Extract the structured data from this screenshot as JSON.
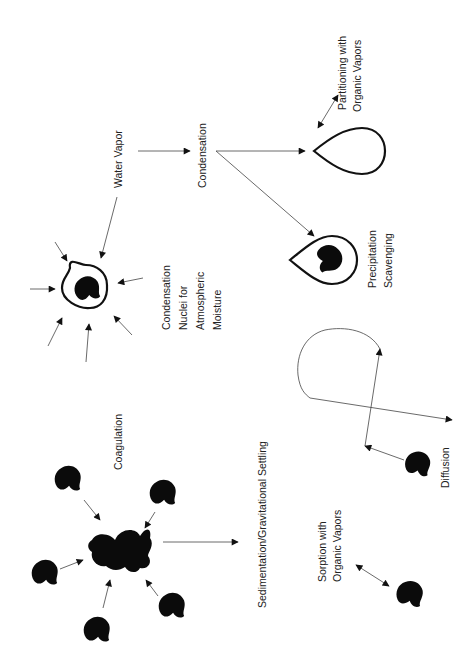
{
  "diagram": {
    "orientation": "rotated 90deg counter-clockwise",
    "labels": {
      "water_vapor": "Water Vapor",
      "condensation": "Condensation",
      "partitioning_line1": "Partitioning with",
      "partitioning_line2": "Organic Vapors",
      "cn_line1": "Condensation",
      "cn_line2": "Nuclei for",
      "cn_line3": "Atmospheric",
      "cn_line4": "Moisture",
      "precip_line1": "Precipitation",
      "precip_line2": "Scavenging",
      "coagulation": "Coagulation",
      "sedimentation": "Sedimentation/Gravitational Settling",
      "sorption_line1": "Sorption with",
      "sorption_line2": "Organic Vapors",
      "diffusion": "Diffusion"
    },
    "colors": {
      "particle": "#0b0b0b",
      "line": "#444444",
      "background": "#ffffff"
    }
  }
}
